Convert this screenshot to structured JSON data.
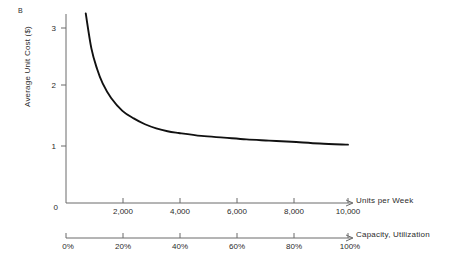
{
  "figure": {
    "panel_label": "B",
    "background_color": "#ffffff",
    "curve_color": "#111111",
    "axis_color": "#6a6a6a"
  },
  "chart_data": {
    "type": "line",
    "title": "",
    "subtitle": "",
    "xlabel": "Units per Week",
    "ylabel": "Average Unit Cost ($)",
    "secondary_xlabel": "Capacity, Utilization",
    "grid": false,
    "legend": null,
    "xlim": [
      0,
      10000
    ],
    "ylim": [
      0,
      3.4
    ],
    "xticks": [
      0,
      2000,
      4000,
      6000,
      8000,
      10000
    ],
    "xticklabels": [
      "0",
      "2,000",
      "4,000",
      "6,000",
      "8,000",
      "10,000"
    ],
    "yticks": [
      0,
      1,
      2,
      3
    ],
    "yticklabels": [
      "0",
      "1",
      "2",
      "3"
    ],
    "secondary_xticks": [
      0,
      20,
      40,
      60,
      80,
      100
    ],
    "secondary_xticklabels": [
      "0%",
      "20%",
      "40%",
      "60%",
      "80%",
      "100%"
    ],
    "series": [
      {
        "name": "Average unit cost",
        "x": [
          700,
          900,
          1100,
          1300,
          1600,
          2000,
          2400,
          2800,
          3200,
          3600,
          4000,
          4800,
          5600,
          6400,
          7200,
          8000,
          9000,
          10000
        ],
        "values": [
          3.25,
          2.65,
          2.3,
          2.05,
          1.8,
          1.58,
          1.45,
          1.35,
          1.28,
          1.23,
          1.2,
          1.15,
          1.12,
          1.09,
          1.07,
          1.05,
          1.02,
          1.0
        ]
      }
    ],
    "annotations": [
      {
        "text": "B",
        "role": "panel-label"
      }
    ]
  }
}
